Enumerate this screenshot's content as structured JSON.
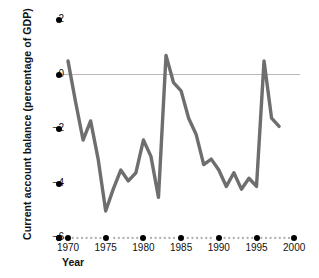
{
  "chart_data": {
    "type": "line",
    "title": "",
    "xlabel": "Year",
    "ylabel": "Current account balance (percentage of GDP)",
    "xlim": [
      1968,
      2000
    ],
    "ylim": [
      -6,
      2
    ],
    "grid": false,
    "legend": null,
    "zero_line": 0,
    "y_ticks": [
      2,
      0,
      -2,
      -4,
      -6
    ],
    "y_tick_labels": [
      "2",
      "0",
      "−2",
      "−4",
      "−6"
    ],
    "x_ticks": [
      1970,
      1975,
      1980,
      1985,
      1990,
      1995,
      2000
    ],
    "x_tick_labels": [
      "1970",
      "1975",
      "1980",
      "1985",
      "1990",
      "1995",
      "2000"
    ],
    "series": [
      {
        "name": "Current account balance",
        "color": "#6e6e6e",
        "x": [
          1970,
          1971,
          1972,
          1973,
          1974,
          1975,
          1976,
          1977,
          1978,
          1979,
          1980,
          1981,
          1982,
          1983,
          1984,
          1985,
          1986,
          1987,
          1988,
          1989,
          1990,
          1991,
          1992,
          1993,
          1994,
          1995,
          1996,
          1997,
          1998
        ],
        "y": [
          0.5,
          -1.0,
          -2.4,
          -1.7,
          -3.1,
          -5.0,
          -4.2,
          -3.5,
          -3.9,
          -3.6,
          -2.4,
          -3.0,
          -4.5,
          0.7,
          -0.3,
          -0.6,
          -1.6,
          -2.2,
          -3.3,
          -3.1,
          -3.5,
          -4.1,
          -3.6,
          -4.2,
          -3.8,
          -4.1,
          0.5,
          -1.6,
          -1.9
        ]
      }
    ]
  },
  "axis": {
    "zero_line_color": "#b8b8b8",
    "tick_dot_color": "#000000",
    "minor_dot_color": "#b0b0b0",
    "text_color": "#111111"
  },
  "labels": {
    "y_title": "Current account balance (percentage of GDP)",
    "x_title": "Year"
  }
}
